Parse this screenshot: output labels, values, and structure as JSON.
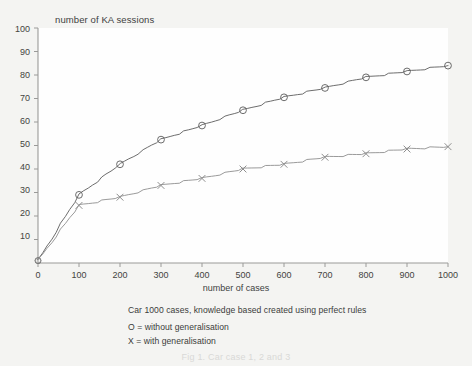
{
  "chart_data": {
    "type": "line",
    "title": "",
    "ylabel": "number of KA sessions",
    "xlabel": "number of cases",
    "xlim": [
      0,
      1000
    ],
    "ylim": [
      0,
      100
    ],
    "grid": false,
    "legend_position": "below-plot",
    "xticks": [
      0,
      100,
      200,
      300,
      400,
      500,
      600,
      700,
      800,
      900,
      1000
    ],
    "yticks": [
      10,
      20,
      30,
      40,
      50,
      60,
      70,
      80,
      90,
      100
    ],
    "x": [
      0,
      100,
      200,
      300,
      400,
      500,
      600,
      700,
      800,
      900,
      1000
    ],
    "series": [
      {
        "name": "O = without generalisation",
        "marker": "circle",
        "color": "#5c5c5c",
        "values": [
          1,
          29,
          42,
          52.5,
          58.5,
          65,
          70.5,
          74.5,
          79,
          81.5,
          84
        ]
      },
      {
        "name": "X = with generalisation",
        "marker": "cross",
        "color": "#8e8e8e",
        "values": [
          1,
          24.5,
          28,
          33,
          36,
          40,
          42,
          45,
          46.5,
          48.5,
          49.5
        ]
      }
    ],
    "annotations": [
      "Car 1000 cases, knowledge based created using perfect rules",
      "O = without generalisation",
      "X = with generalisation"
    ]
  },
  "axis": {
    "y_title": "number of KA sessions",
    "x_title": "number of cases",
    "y_tick_labels": [
      "100",
      "90",
      "80",
      "70",
      "60",
      "50",
      "40",
      "30",
      "20",
      "10"
    ],
    "x_tick_labels": [
      "0",
      "100",
      "200",
      "300",
      "400",
      "500",
      "600",
      "700",
      "800",
      "900",
      "1000"
    ]
  },
  "caption": {
    "line1": "Car 1000 cases, knowledge based created using perfect rules",
    "line2": "O = without generalisation",
    "line3": "X = with generalisation",
    "figure_caption": "Fig 1. Car case 1, 2 and 3"
  },
  "colors": {
    "background": "#f4f4f2",
    "plot_background": "#fefefe",
    "series_o": "#5c5c5c",
    "series_x": "#8e8e8e",
    "axis": "#9a9a98",
    "text": "#3a3a3a"
  }
}
